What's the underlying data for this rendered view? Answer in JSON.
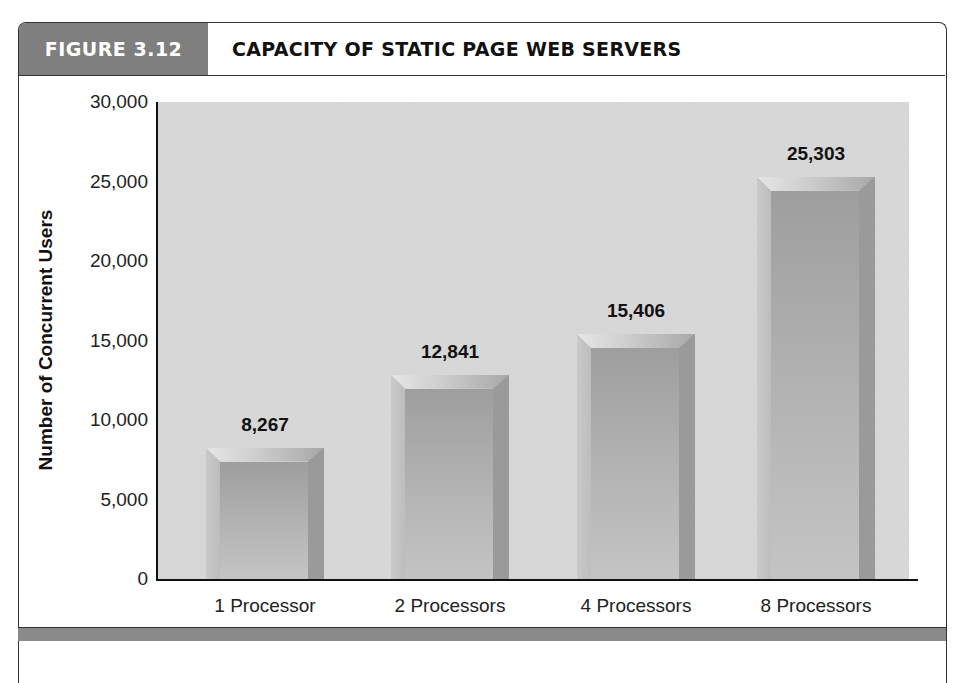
{
  "figure": {
    "tag": "FIGURE 3.12",
    "title": "CAPACITY OF STATIC PAGE WEB SERVERS"
  },
  "chart_data": {
    "type": "bar",
    "title": "CAPACITY OF STATIC PAGE WEB SERVERS",
    "xlabel": "",
    "ylabel": "Number of Concurrent Users",
    "categories": [
      "1 Processor",
      "2 Processors",
      "4 Processors",
      "8 Processors"
    ],
    "values": [
      8267,
      12841,
      15406,
      25303
    ],
    "value_labels": [
      "8,267",
      "12,841",
      "15,406",
      "25,303"
    ],
    "ylim": [
      0,
      30000
    ],
    "yticks": [
      0,
      5000,
      10000,
      15000,
      20000,
      25000,
      30000
    ],
    "ytick_labels": [
      "0",
      "5,000",
      "10,000",
      "15,000",
      "20,000",
      "25,000",
      "30,000"
    ],
    "grid": false,
    "legend": null,
    "colors": {
      "bar": "#b0b0b0",
      "plot_bg": "#d6d6d6",
      "header_tag": "#7f7f7f"
    }
  }
}
